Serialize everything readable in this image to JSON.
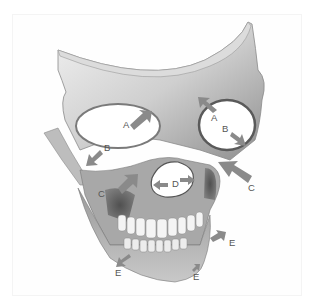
{
  "figure": {
    "labels": [
      {
        "id": "A1",
        "text": "A",
        "x": 123,
        "y": 124
      },
      {
        "id": "A2",
        "text": "A",
        "x": 211,
        "y": 117
      },
      {
        "id": "B1",
        "text": "B",
        "x": 104,
        "y": 147
      },
      {
        "id": "B2",
        "text": "B",
        "x": 222,
        "y": 128
      },
      {
        "id": "C1",
        "text": "C",
        "x": 98,
        "y": 193
      },
      {
        "id": "C2",
        "text": "C",
        "x": 248,
        "y": 187
      },
      {
        "id": "D",
        "text": "D",
        "x": 172,
        "y": 183
      },
      {
        "id": "E1",
        "text": "E",
        "x": 115,
        "y": 272
      },
      {
        "id": "E2",
        "text": "E",
        "x": 193,
        "y": 276
      },
      {
        "id": "E3",
        "text": "E",
        "x": 229,
        "y": 242
      }
    ],
    "colors": {
      "background": "#ffffff",
      "bone_light": "#e9e9e9",
      "bone_mid": "#b5b5b5",
      "bone_dark": "#4a4a4a",
      "arrow": "#8a8a8a",
      "label": "#555555"
    }
  }
}
